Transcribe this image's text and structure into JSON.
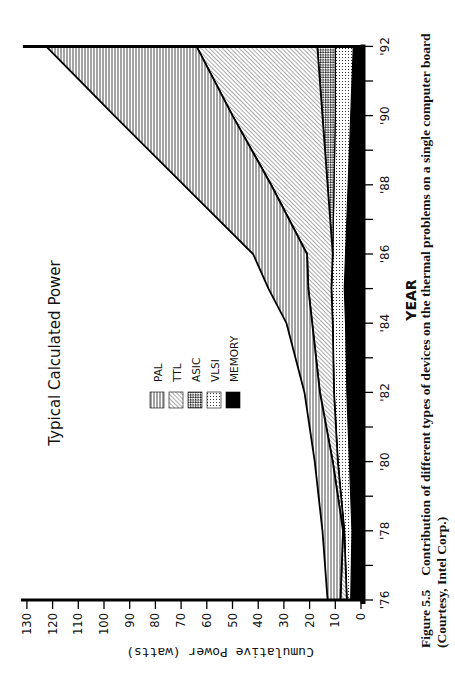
{
  "chart_data": {
    "type": "area",
    "stacked": true,
    "title": "Typical Calculated Power",
    "xlabel": "YEAR",
    "ylabel": "Cumulative Power (watts)",
    "x": [
      1976,
      1978,
      1980,
      1982,
      1984,
      1985,
      1986,
      1988,
      1990,
      1992
    ],
    "x_tick_labels": [
      "'76",
      "'78",
      "'80",
      "'82",
      "'84",
      "'86",
      "'88",
      "'90",
      "'92"
    ],
    "x_ticks": [
      1976,
      1977,
      1978,
      1979,
      1980,
      1981,
      1982,
      1983,
      1984,
      1985,
      1986,
      1987,
      1988,
      1989,
      1990,
      1991,
      1992
    ],
    "y_ticks": [
      0,
      10,
      20,
      30,
      40,
      50,
      60,
      70,
      80,
      90,
      100,
      110,
      120,
      130
    ],
    "ylim": [
      0,
      130
    ],
    "xlim": [
      1976,
      1992
    ],
    "grid": false,
    "legend_position": "inside-center",
    "cumulative_tops": {
      "MEMORY": [
        4,
        3.5,
        4.5,
        5.5,
        6,
        6.5,
        6,
        5,
        4,
        3
      ],
      "VLSI": [
        5.5,
        6.5,
        9,
        10.5,
        11,
        11.5,
        11,
        10.5,
        10,
        10
      ],
      "ASIC": [
        5.5,
        6.5,
        9,
        10.5,
        11,
        11.5,
        11,
        13,
        15,
        17
      ],
      "TTL": [
        8,
        7,
        11,
        16,
        19,
        20.5,
        21,
        35,
        50,
        64
      ],
      "PAL": [
        13,
        15,
        18,
        22,
        29,
        36,
        42,
        69,
        96,
        122.5
      ]
    },
    "series": [
      {
        "name": "MEMORY",
        "pattern": "solid-black",
        "values": [
          4,
          3.5,
          4.5,
          5.5,
          6,
          6.5,
          6,
          5,
          4,
          3
        ]
      },
      {
        "name": "VLSI",
        "pattern": "dotted-grid",
        "values": [
          1.5,
          3,
          4.5,
          5,
          5,
          5,
          5,
          5.5,
          6,
          7
        ]
      },
      {
        "name": "ASIC",
        "pattern": "dense-crosshatch",
        "values": [
          0,
          0,
          0,
          0,
          0,
          0,
          0,
          2.5,
          5,
          7
        ]
      },
      {
        "name": "TTL",
        "pattern": "diagonal-hatch",
        "values": [
          2.5,
          0.5,
          2,
          5.5,
          8,
          9,
          10,
          22,
          35,
          47
        ]
      },
      {
        "name": "PAL",
        "pattern": "horizontal-lines",
        "values": [
          5,
          8,
          7,
          6,
          10,
          15.5,
          21,
          34,
          46,
          58.5
        ]
      }
    ],
    "legend": [
      "PAL",
      "TTL",
      "ASIC",
      "VLSI",
      "MEMORY"
    ]
  },
  "figure": {
    "caption_label": "Figure 5.5",
    "caption_text": "Contribution of different types of devices on the thermal problems on a single computer board",
    "caption_line2": "(Courtesy, Intel Corp.)"
  }
}
